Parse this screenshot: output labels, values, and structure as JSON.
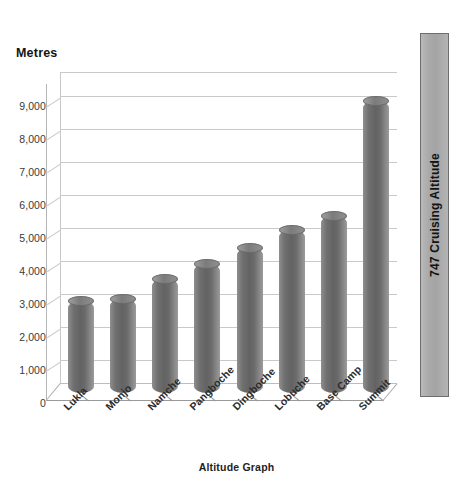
{
  "chart_data": {
    "type": "bar",
    "title": "",
    "xlabel": "Altitude Graph",
    "ylabel": "Metres",
    "categories": [
      "Lukla",
      "Monjo",
      "Namche",
      "Pangboche",
      "Dingboche",
      "Lobuche",
      "Base Camp",
      "Summit"
    ],
    "values": [
      2800,
      2835,
      3440,
      3900,
      4400,
      4950,
      5350,
      8850
    ],
    "series": [
      {
        "name": "Altitude",
        "values": [
          2800,
          2835,
          3440,
          3900,
          4400,
          4950,
          5350,
          8850
        ]
      }
    ],
    "ylim": [
      0,
      9000
    ],
    "yticks": [
      0,
      1000,
      2000,
      3000,
      4000,
      5000,
      6000,
      7000,
      8000,
      9000
    ],
    "ytick_labels": [
      "0",
      "1,000",
      "2,000",
      "3,000",
      "4,000",
      "5,000",
      "6,000",
      "7,000",
      "8,000",
      "9,000"
    ],
    "grid": true,
    "legend": false,
    "style": "3d-cylinder",
    "bar_color": "#6f6f6f",
    "gridline_color": "#c9c9c9",
    "background_color": "#ffffff",
    "annotations": [
      {
        "name": "747 Cruising Altitude",
        "label": "747 Cruising Altitude",
        "orientation": "vertical",
        "color": "#a9a9a9",
        "position": "right-of-plot"
      }
    ]
  }
}
